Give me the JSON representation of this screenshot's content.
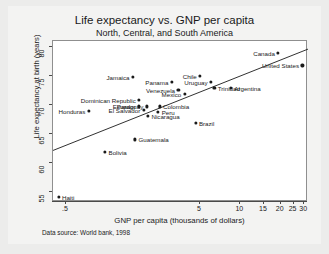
{
  "chart_data": {
    "type": "scatter",
    "title": "Life expectancy vs. GNP per capita",
    "subtitle": "North, Central, and South America",
    "xlabel": "GNP per capita (thousands of dollars)",
    "ylabel": "Life expectancy at birth (years)",
    "note": "Data source:  World bank, 1998",
    "xscale": "log",
    "xlim": [
      0.4,
      32
    ],
    "ylim": [
      53.2,
      81.0
    ],
    "grid": false,
    "legend": false,
    "xticks": [
      {
        "value": 0.5,
        "label": ".5"
      },
      {
        "value": 5,
        "label": "5"
      },
      {
        "value": 10,
        "label": "10"
      },
      {
        "value": 15,
        "label": "15"
      },
      {
        "value": 20,
        "label": "20"
      },
      {
        "value": 25,
        "label": "25"
      },
      {
        "value": 30,
        "label": "30"
      }
    ],
    "yticks": [
      {
        "value": 55,
        "label": "55"
      },
      {
        "value": 60,
        "label": "60"
      },
      {
        "value": 65,
        "label": "65"
      },
      {
        "value": 70,
        "label": "70"
      },
      {
        "value": 75,
        "label": "75"
      },
      {
        "value": 80,
        "label": "80"
      }
    ],
    "fit_line": {
      "type": "linear-fit-on-log-x",
      "x_start": 0.4,
      "y_start": 62.1,
      "x_end": 32.0,
      "y_end": 79.6
    },
    "points": [
      {
        "name": "Haiti",
        "x": 0.44,
        "y": 54.1,
        "label_side": "right"
      },
      {
        "name": "Honduras",
        "x": 0.74,
        "y": 68.9,
        "label_side": "left"
      },
      {
        "name": "Bolivia",
        "x": 0.98,
        "y": 61.9,
        "label_side": "right"
      },
      {
        "name": "Dominican Republic",
        "x": 1.76,
        "y": 70.8,
        "label_side": "left"
      },
      {
        "name": "Ecuador",
        "x": 1.76,
        "y": 69.7,
        "label_side": "left"
      },
      {
        "name": "Jamaica",
        "x": 1.58,
        "y": 74.8,
        "label_side": "left"
      },
      {
        "name": "El Salvador",
        "x": 1.9,
        "y": 69.1,
        "label_side": "left"
      },
      {
        "name": "Guatemala",
        "x": 1.64,
        "y": 64.0,
        "label_side": "right"
      },
      {
        "name": "Paraguay",
        "x": 2.0,
        "y": 69.7,
        "label_side": "left"
      },
      {
        "name": "Nicaragua",
        "x": 2.05,
        "y": 68.1,
        "label_side": "right"
      },
      {
        "name": "Peru",
        "x": 2.44,
        "y": 68.7,
        "label_side": "right"
      },
      {
        "name": "Colombia",
        "x": 2.5,
        "y": 69.7,
        "label_side": "right"
      },
      {
        "name": "Panama",
        "x": 3.08,
        "y": 73.9,
        "label_side": "left"
      },
      {
        "name": "Venezuela",
        "x": 3.45,
        "y": 72.6,
        "label_side": "left"
      },
      {
        "name": "Mexico",
        "x": 3.84,
        "y": 71.8,
        "label_side": "left"
      },
      {
        "name": "Brazil",
        "x": 4.63,
        "y": 66.8,
        "label_side": "right"
      },
      {
        "name": "Chile",
        "x": 5.02,
        "y": 75.0,
        "label_side": "left"
      },
      {
        "name": "Uruguay",
        "x": 6.05,
        "y": 73.9,
        "label_side": "left"
      },
      {
        "name": "Trinidad",
        "x": 6.4,
        "y": 72.9,
        "label_side": "right"
      },
      {
        "name": "Argentina",
        "x": 8.5,
        "y": 72.9,
        "label_side": "right"
      },
      {
        "name": "Canada",
        "x": 19.2,
        "y": 79.0,
        "label_side": "left"
      },
      {
        "name": "United States",
        "x": 29.1,
        "y": 76.8,
        "label_side": "left"
      }
    ]
  }
}
